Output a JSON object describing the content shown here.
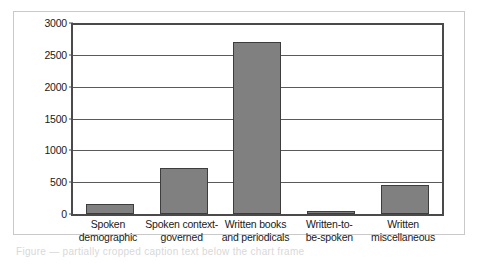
{
  "chart_data": {
    "type": "bar",
    "title": "",
    "subtitle": "",
    "xlabel": "",
    "ylabel": "",
    "categories": [
      "Spoken\ndemographic",
      "Spoken context-\ngoverned",
      "Written books\nand periodicals",
      "Written-to-\nbe-spoken",
      "Written\nmiscellaneous"
    ],
    "category_lines": [
      [
        "Spoken",
        "demographic"
      ],
      [
        "Spoken context-",
        "governed"
      ],
      [
        "Written books",
        "and periodicals"
      ],
      [
        "Written-to-",
        "be-spoken"
      ],
      [
        "Written",
        "miscellaneous"
      ]
    ],
    "values": [
      150,
      730,
      2700,
      50,
      450
    ],
    "ylim": [
      0,
      3000
    ],
    "ytick_values": [
      0,
      500,
      1000,
      1500,
      2000,
      2500,
      3000
    ],
    "ytick_labels": [
      "0",
      "500",
      "1000",
      "1500",
      "2000",
      "2500",
      "3000"
    ],
    "grid": true,
    "legend": false,
    "legend_position": "none",
    "bar_color": "#808080",
    "bar_edge_color": "#3d3d3d",
    "axis_color": "#4a4a4a",
    "grid_color": "#5a5a5a",
    "frame_color": "#c9c9c9",
    "background": "#ffffff"
  },
  "figure": {
    "caption_artifact": "Figure — partially cropped caption text below the chart frame"
  }
}
